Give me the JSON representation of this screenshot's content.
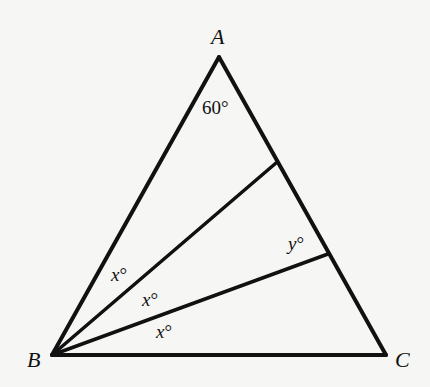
{
  "diagram": {
    "type": "triangle-with-angle-trisectors",
    "vertices": {
      "A": {
        "label": "A",
        "x": 219,
        "y": 57
      },
      "B": {
        "label": "B",
        "x": 52,
        "y": 355
      },
      "C": {
        "label": "C",
        "x": 386,
        "y": 355
      }
    },
    "cevians": [
      {
        "from": "B",
        "to_point": {
          "x": 276,
          "y": 163
        }
      },
      {
        "from": "B",
        "to_point": {
          "x": 328,
          "y": 254
        }
      }
    ],
    "angle_labels": {
      "apex": {
        "text": "60°",
        "x": 202,
        "y": 114
      },
      "b_upper": {
        "var": "x",
        "deg": "°",
        "x": 109,
        "y": 281
      },
      "b_middle": {
        "var": "x",
        "deg": "°",
        "x": 143,
        "y": 305
      },
      "b_lower": {
        "var": "x",
        "deg": "°",
        "x": 156,
        "y": 335
      },
      "y_angle": {
        "var": "y",
        "deg": "°",
        "x": 286,
        "y": 248
      }
    }
  }
}
